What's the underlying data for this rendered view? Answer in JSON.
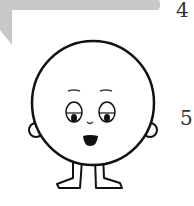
{
  "page_numbers": {
    "top": "4",
    "middle": "5"
  },
  "colors": {
    "banner": "#c8c8c8",
    "outline": "#111111",
    "background": "#ffffff"
  },
  "illustration": {
    "subject": "cartoon round character with face, ears and legs"
  }
}
